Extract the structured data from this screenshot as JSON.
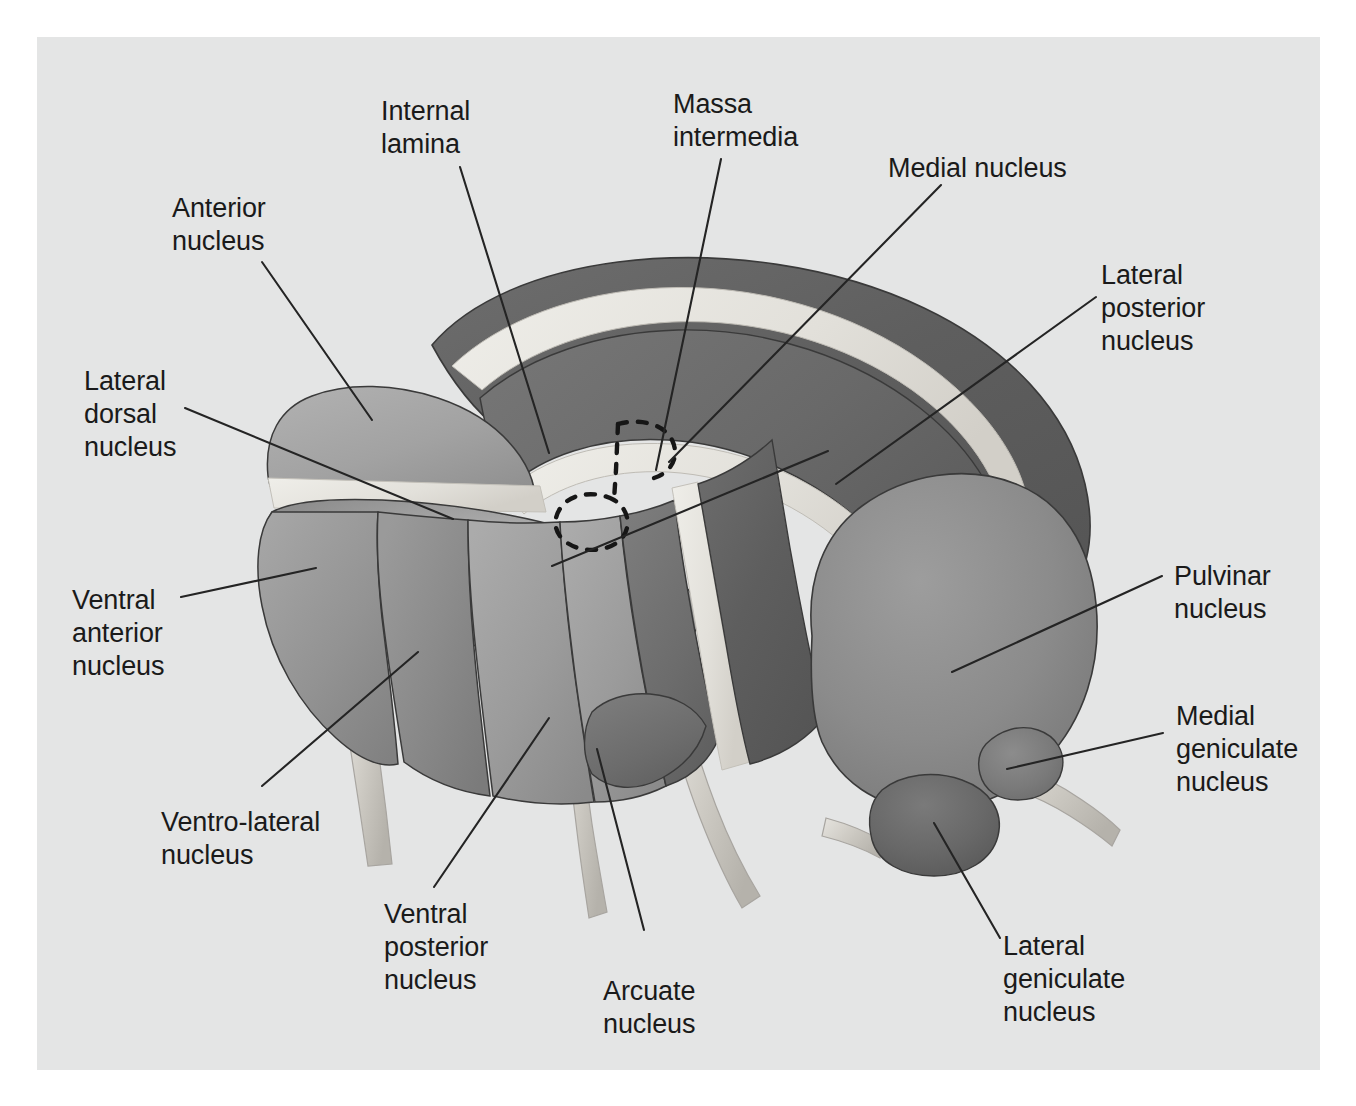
{
  "figure": {
    "background_color": "#ffffff",
    "plate_color": "#e4e5e5",
    "label_color": "#1a1a1a",
    "leader_color": "#242424"
  },
  "palette": {
    "plate": "#e4e5e5",
    "lamina_light": "#e9e8e4",
    "anterior": "#a3a3a3",
    "lateral_dorsal": "#999999",
    "ventral_anterior": "#9a9a9a",
    "ventro_lateral": "#8f8f8f",
    "ventral_posterior": "#9d9d9d",
    "arcuate": "#6f6f6f",
    "medial_nucleus": "#636363",
    "lateral_posterior": "#6a6a6a",
    "pulvinar": "#8a8a8a",
    "medial_geniculate": "#7c7c7c",
    "lateral_geniculate": "#666666",
    "stalk": "#d6d4cf",
    "outline": "#3a3a3a"
  },
  "labels": [
    {
      "id": "anterior-nucleus",
      "text": "Anterior\nnucleus",
      "x": 172,
      "y": 192,
      "align": "left"
    },
    {
      "id": "internal-lamina",
      "text": "Internal\nlamina",
      "x": 381,
      "y": 95,
      "align": "left"
    },
    {
      "id": "massa-intermedia",
      "text": "Massa\nintermedia",
      "x": 673,
      "y": 88,
      "align": "left"
    },
    {
      "id": "medial-nucleus",
      "text": "Medial nucleus",
      "x": 888,
      "y": 152,
      "align": "left"
    },
    {
      "id": "lateral-posterior-nucleus",
      "text": "Lateral\nposterior\nnucleus",
      "x": 1101,
      "y": 259,
      "align": "left"
    },
    {
      "id": "lateral-dorsal-nucleus",
      "text": "Lateral\ndorsal\nnucleus",
      "x": 84,
      "y": 365,
      "align": "left"
    },
    {
      "id": "ventral-anterior-nucleus",
      "text": "Ventral\nanterior\nnucleus",
      "x": 72,
      "y": 584,
      "align": "left"
    },
    {
      "id": "pulvinar-nucleus",
      "text": "Pulvinar\nnucleus",
      "x": 1174,
      "y": 560,
      "align": "left"
    },
    {
      "id": "medial-geniculate-nucleus",
      "text": "Medial\ngeniculate\nnucleus",
      "x": 1176,
      "y": 700,
      "align": "left"
    },
    {
      "id": "ventro-lateral-nucleus",
      "text": "Ventro-lateral\nnucleus",
      "x": 161,
      "y": 806,
      "align": "left"
    },
    {
      "id": "ventral-posterior-nucleus",
      "text": "Ventral\nposterior\nnucleus",
      "x": 384,
      "y": 898,
      "align": "left"
    },
    {
      "id": "arcuate-nucleus",
      "text": "Arcuate\nnucleus",
      "x": 603,
      "y": 975,
      "align": "left"
    },
    {
      "id": "lateral-geniculate-nucleus",
      "text": "Lateral\ngeniculate\nnucleus",
      "x": 1003,
      "y": 930,
      "align": "left"
    }
  ],
  "leaders": [
    {
      "id": "leader-anterior-nucleus",
      "points": "262,262 372,420"
    },
    {
      "id": "leader-internal-lamina",
      "points": "460,167 549,453"
    },
    {
      "id": "leader-massa-intermedia",
      "points": "721,159 656,470"
    },
    {
      "id": "leader-medial-nucleus",
      "points": "941,185 669,462"
    },
    {
      "id": "leader-lateral-posterior-nucleus",
      "points": "1096,297 836,484"
    },
    {
      "id": "leader-lateral-dorsal-nucleus",
      "points": "185,408 453,519"
    },
    {
      "id": "leader-ventral-anterior-nucleus",
      "points": "181,597 316,568"
    },
    {
      "id": "leader-pulvinar-nucleus",
      "points": "1162,576 952,672"
    },
    {
      "id": "leader-medial-geniculate-nucleus",
      "points": "1163,733 1007,769"
    },
    {
      "id": "leader-ventro-lateral-nucleus",
      "points": "262,786 418,652"
    },
    {
      "id": "leader-ventral-posterior-nucleus",
      "points": "434,887 549,718"
    },
    {
      "id": "leader-arcuate-nucleus",
      "points": "644,930 597,749"
    },
    {
      "id": "leader-lateral-geniculate-nucleus",
      "points": "1000,938 934,823"
    },
    {
      "id": "leader-medial-nucleus-extra",
      "points": "552,566 828,451"
    }
  ],
  "regions": [
    {
      "id": "medial-nucleus-arch",
      "label": "Medial nucleus"
    },
    {
      "id": "lateral-posterior-band",
      "label": "Lateral posterior nucleus"
    },
    {
      "id": "anterior-nucleus-body",
      "label": "Anterior nucleus"
    },
    {
      "id": "lateral-dorsal-body",
      "label": "Lateral dorsal nucleus"
    },
    {
      "id": "ventral-anterior-body",
      "label": "Ventral anterior nucleus"
    },
    {
      "id": "ventro-lateral-body",
      "label": "Ventro-lateral nucleus"
    },
    {
      "id": "ventral-posterior-body",
      "label": "Ventral posterior nucleus"
    },
    {
      "id": "arcuate-body",
      "label": "Arcuate nucleus"
    },
    {
      "id": "pulvinar-dome",
      "label": "Pulvinar nucleus"
    },
    {
      "id": "medial-geniculate-body",
      "label": "Medial geniculate nucleus"
    },
    {
      "id": "lateral-geniculate-body",
      "label": "Lateral geniculate nucleus"
    },
    {
      "id": "internal-lamina-bands",
      "label": "Internal lamina"
    },
    {
      "id": "massa-intermedia-outline",
      "label": "Massa intermedia"
    }
  ]
}
